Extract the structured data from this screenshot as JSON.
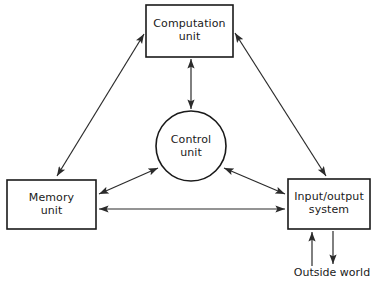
{
  "diagram": {
    "background_color": "#ffffff",
    "line_color": "#2b2b2b",
    "text_color": "#1a1a1a",
    "nodes": [
      {
        "id": "computation-unit",
        "label": "Computation\nunit",
        "shape": "rectangle",
        "x": 146,
        "y": 5,
        "width": 87,
        "height": 52
      },
      {
        "id": "control-unit",
        "label": "Control\nunit",
        "shape": "circle",
        "cx": 191,
        "cy": 146,
        "r": 35
      },
      {
        "id": "memory-unit",
        "label": "Memory\nunit",
        "shape": "rectangle",
        "x": 7,
        "y": 180,
        "width": 89,
        "height": 49
      },
      {
        "id": "input-output-system",
        "label": "Input/output\nsystem",
        "shape": "rectangle",
        "x": 288,
        "y": 179,
        "width": 82,
        "height": 50
      }
    ],
    "external_labels": [
      {
        "id": "outside-world",
        "text": "Outside world",
        "x": 292,
        "y": 266
      }
    ],
    "connectors": [
      {
        "id": "memory-to-computation",
        "from": "memory-unit",
        "to": "computation-unit",
        "arrows": "both"
      },
      {
        "id": "computation-to-io",
        "from": "computation-unit",
        "to": "input-output-system",
        "arrows": "both"
      },
      {
        "id": "computation-to-control",
        "from": "computation-unit",
        "to": "control-unit",
        "arrows": "both"
      },
      {
        "id": "memory-to-control",
        "from": "memory-unit",
        "to": "control-unit",
        "arrows": "both"
      },
      {
        "id": "control-to-io",
        "from": "control-unit",
        "to": "input-output-system",
        "arrows": "both"
      },
      {
        "id": "memory-to-io",
        "from": "memory-unit",
        "to": "input-output-system",
        "arrows": "both"
      },
      {
        "id": "outside-world-input",
        "from": "outside-world",
        "to": "input-output-system",
        "arrows": "single-up"
      },
      {
        "id": "io-output-to-outside-world",
        "from": "input-output-system",
        "to": "outside-world",
        "arrows": "single-down"
      }
    ]
  }
}
